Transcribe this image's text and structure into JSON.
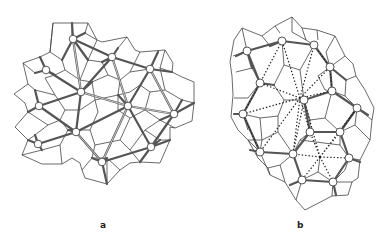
{
  "figure": {
    "panels": [
      {
        "id": "a",
        "label": "a",
        "description": "Voronoi-like tessellation with thick double-line edges connecting circular nodes",
        "nodes": [
          [
            73,
            39
          ],
          [
            112,
            57
          ],
          [
            150,
            69
          ],
          [
            46,
            70
          ],
          [
            81,
            92
          ],
          [
            39,
            106
          ],
          [
            128,
            106
          ],
          [
            174,
            114
          ],
          [
            76,
            132
          ],
          [
            38,
            144
          ],
          [
            151,
            147
          ],
          [
            102,
            162
          ]
        ]
      },
      {
        "id": "b",
        "label": "b",
        "description": "Tessellation with circular nodes on cell boundaries and dotted triangulation lines to hub points",
        "nodes": [
          [
            247,
            51
          ],
          [
            282,
            41
          ],
          [
            314,
            45
          ],
          [
            330,
            67
          ],
          [
            260,
            83
          ],
          [
            304,
            100
          ],
          [
            332,
            91
          ],
          [
            357,
            108
          ],
          [
            243,
            114
          ],
          [
            310,
            132
          ],
          [
            340,
            132
          ],
          [
            260,
            152
          ],
          [
            293,
            154
          ],
          [
            349,
            158
          ],
          [
            302,
            180
          ],
          [
            333,
            182
          ]
        ],
        "hubs": [
          [
            300,
            98
          ],
          [
            320,
            157
          ]
        ]
      }
    ],
    "colors": {
      "line": "#444444",
      "background": "#ffffff"
    }
  }
}
